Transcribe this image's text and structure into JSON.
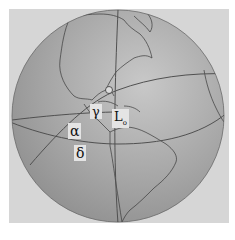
{
  "figure": {
    "labels": {
      "gamma": "γ",
      "L": "L",
      "L_sub": "o",
      "alpha": "α",
      "delta": "δ"
    },
    "colors": {
      "background": "#ffffff",
      "frame": "#d6d6d6",
      "globe": "#a4a4a4",
      "globe_highlight": "#c4c4c4",
      "lines": "#555555",
      "coast": "#333333"
    }
  }
}
